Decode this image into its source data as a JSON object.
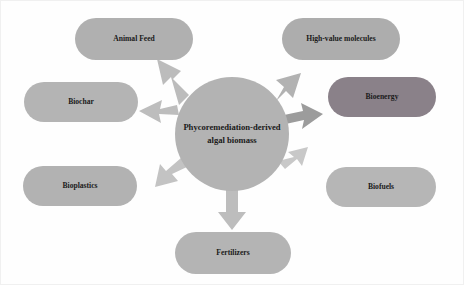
{
  "diagram": {
    "type": "hub-and-spoke",
    "hub": {
      "id": "phycoremediation-hub",
      "line1": "Phycoremediation-derived",
      "line2": "algal biomass",
      "shape": "circle",
      "color": "#b3b3b3",
      "cx": 231,
      "cy": 133,
      "r": 57
    },
    "nodes": [
      {
        "id": "animal-feed",
        "label": "Animal Feed",
        "shape": "pill",
        "color": "#b0b0b0",
        "cx": 133,
        "cy": 38,
        "rx": 59,
        "ry": 21
      },
      {
        "id": "high-value-molecules",
        "label": "High-value molecules",
        "shape": "pill",
        "color": "#adadad",
        "cx": 340,
        "cy": 38,
        "rx": 59,
        "ry": 21
      },
      {
        "id": "biochar",
        "label": "Biochar",
        "shape": "pill",
        "color": "#b4b4b4",
        "cx": 80,
        "cy": 101,
        "rx": 57,
        "ry": 20
      },
      {
        "id": "bioenergy",
        "label": "Bioenergy",
        "shape": "pill",
        "color": "#8a8189",
        "cx": 381,
        "cy": 96,
        "rx": 54,
        "ry": 20
      },
      {
        "id": "bioplastics",
        "label": "Bioplastics",
        "shape": "pill",
        "color": "#b2b2b2",
        "cx": 79,
        "cy": 185,
        "rx": 57,
        "ry": 20
      },
      {
        "id": "biofuels",
        "label": "Biofuels",
        "shape": "pill",
        "color": "#b6b6b6",
        "cx": 380,
        "cy": 186,
        "rx": 55,
        "ry": 20
      },
      {
        "id": "fertilizers",
        "label": "Fertilizers",
        "shape": "pill",
        "color": "#b4b4b4",
        "cx": 232,
        "cy": 252,
        "rx": 58,
        "ry": 21
      }
    ],
    "arrows": [
      {
        "id": "arrow-to-animal-feed",
        "target": "animal-feed",
        "angle_deg": 237,
        "color": "#b9b9b9"
      },
      {
        "id": "arrow-to-high-value-molecules",
        "target": "high-value-molecules",
        "angle_deg": 303,
        "color": "#b0b0b0"
      },
      {
        "id": "arrow-to-biochar",
        "target": "biochar",
        "angle_deg": 199,
        "color": "#bdbdbd"
      },
      {
        "id": "arrow-to-bioenergy",
        "target": "bioenergy",
        "angle_deg": 339,
        "color": "#9a9a9a"
      },
      {
        "id": "arrow-to-bioplastics",
        "target": "bioplastics",
        "angle_deg": 154,
        "color": "#c2c2c2"
      },
      {
        "id": "arrow-to-biofuels",
        "target": "biofuels",
        "angle_deg": 25,
        "color": "#c6c6c6"
      },
      {
        "id": "arrow-to-fertilizers",
        "target": "fertilizers",
        "angle_deg": 90,
        "color": "#bcbcbc"
      }
    ]
  }
}
